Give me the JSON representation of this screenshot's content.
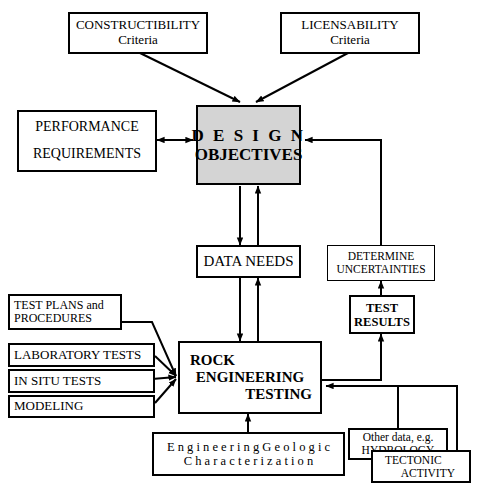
{
  "diagram": {
    "background": "#ffffff",
    "line_color": "#000000",
    "highlight_fill": "#d4d4d4"
  },
  "nodes": {
    "constructibility": {
      "line1": "CONSTRUCTIBILITY",
      "line2": "Criteria"
    },
    "licensability": {
      "line1": "LICENSABILITY",
      "line2": "Criteria"
    },
    "design_objectives": {
      "line1": "D E S I G N",
      "line2": "OBJECTIVES"
    },
    "performance": {
      "line1": "PERFORMANCE",
      "line2": "REQUIREMENTS"
    },
    "data_needs": {
      "line1": "DATA NEEDS"
    },
    "determine_uncertainties": {
      "line1": "DETERMINE",
      "line2": "UNCERTAINTIES"
    },
    "test_results": {
      "line1": "TEST",
      "line2": "RESULTS"
    },
    "rock_engineering_testing": {
      "line1": "ROCK",
      "line2": "ENGINEERING",
      "line3": "TESTING"
    },
    "test_plans": {
      "line1": "TEST PLANS and",
      "line2": "PROCEDURES"
    },
    "laboratory_tests": {
      "line1": "LABORATORY  TESTS"
    },
    "in_situ_tests": {
      "line1": "IN SITU  TESTS"
    },
    "modeling": {
      "line1": "MODELING"
    },
    "engineering_geologic": {
      "line1": "E n g i n e e r i n g   G e o l o g i c",
      "line2": "C h a r a c t e r i z a t i o n"
    },
    "other_data": {
      "line1": "Other data, e.g.",
      "line2": "HYDROLOGY"
    },
    "tectonic_activity": {
      "line1": "TECTONIC",
      "line2": "ACTIVITY"
    }
  },
  "edges": [
    {
      "name": "constructibility-to-design",
      "from": "constructibility",
      "to": "design_objectives",
      "style": "diagonal-arrow"
    },
    {
      "name": "licensability-to-design",
      "from": "licensability",
      "to": "design_objectives",
      "style": "diagonal-arrow"
    },
    {
      "name": "performance-design-bidirectional",
      "from": "performance",
      "to": "design_objectives",
      "style": "double-arrow"
    },
    {
      "name": "design-to-data-needs",
      "from": "design_objectives",
      "to": "data_needs",
      "style": "arrow-down"
    },
    {
      "name": "data-needs-to-design",
      "from": "data_needs",
      "to": "design_objectives",
      "style": "arrow-up"
    },
    {
      "name": "data-needs-to-rock",
      "from": "data_needs",
      "to": "rock_engineering_testing",
      "style": "arrow-down"
    },
    {
      "name": "rock-to-data-needs",
      "from": "rock_engineering_testing",
      "to": "data_needs",
      "style": "arrow-up"
    },
    {
      "name": "rock-to-test-results",
      "from": "rock_engineering_testing",
      "to": "test_results",
      "style": "elbow-arrow-up"
    },
    {
      "name": "test-results-to-uncertainties",
      "from": "test_results",
      "to": "determine_uncertainties",
      "style": "arrow-up"
    },
    {
      "name": "uncertainties-to-design",
      "from": "determine_uncertainties",
      "to": "design_objectives",
      "style": "elbow-arrow-left"
    },
    {
      "name": "test-plans-to-rock",
      "from": "test_plans",
      "to": "rock_engineering_testing",
      "style": "converge"
    },
    {
      "name": "laboratory-to-rock",
      "from": "laboratory_tests",
      "to": "rock_engineering_testing",
      "style": "converge"
    },
    {
      "name": "in-situ-to-rock",
      "from": "in_situ_tests",
      "to": "rock_engineering_testing",
      "style": "converge"
    },
    {
      "name": "modeling-to-rock",
      "from": "modeling",
      "to": "rock_engineering_testing",
      "style": "converge"
    },
    {
      "name": "geologic-to-rock",
      "from": "engineering_geologic",
      "to": "rock_engineering_testing",
      "style": "arrow-up"
    },
    {
      "name": "other-data-to-rock",
      "from": "other_data",
      "to": "rock_engineering_testing",
      "style": "elbow-arrow-left"
    },
    {
      "name": "tectonic-to-rock",
      "from": "tectonic_activity",
      "to": "rock_engineering_testing",
      "style": "elbow-arrow-left"
    }
  ]
}
